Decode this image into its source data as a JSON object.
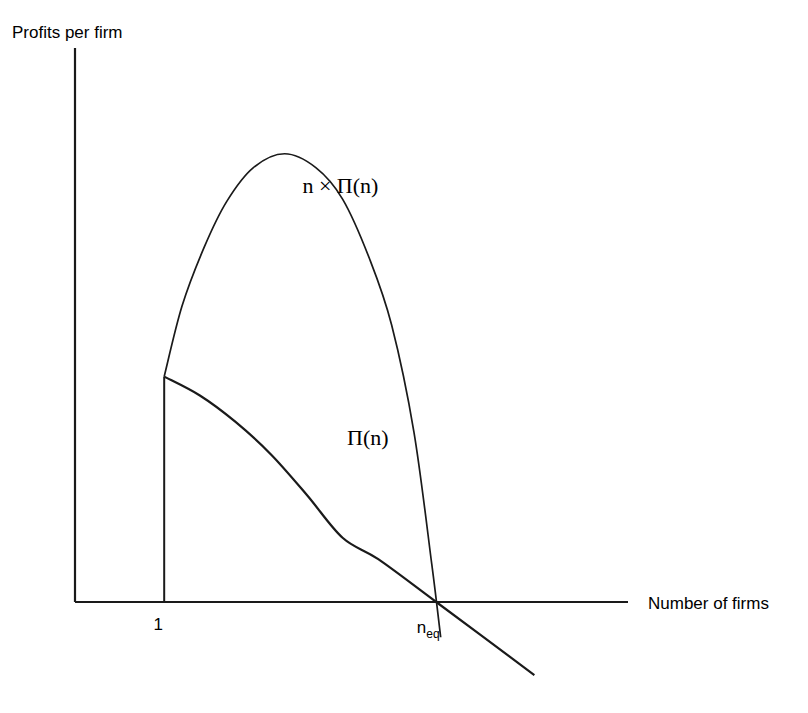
{
  "chart_data": {
    "type": "line",
    "title": "",
    "xlabel": "Number of firms",
    "ylabel": "Profits per firm",
    "grid": false,
    "legend": "inline-annotations",
    "xlim": [
      0,
      6.2
    ],
    "ylim": [
      -1.35,
      4.4
    ],
    "x_ticks": [
      {
        "label": "1",
        "value": 1
      },
      {
        "label": "n",
        "sub": "eq",
        "value": 4.05
      }
    ],
    "annotations": [
      {
        "text": "n × Π(n)",
        "x": 2.55,
        "y": 3.25
      },
      {
        "text": "Π(n)",
        "x": 3.05,
        "y": 1.25
      }
    ],
    "series": [
      {
        "name": "n × Π(n)",
        "label": "n × Π(n)",
        "color": "#1a1a1a",
        "description": "Aggregate industry profit; rises from n=1, peaks near n=2.35, then falls steeply to zero at n_eq",
        "points": [
          [
            1.0,
            1.79
          ],
          [
            1.2,
            2.35
          ],
          [
            1.45,
            2.82
          ],
          [
            1.7,
            3.18
          ],
          [
            2.0,
            3.45
          ],
          [
            2.35,
            3.56
          ],
          [
            2.7,
            3.45
          ],
          [
            3.0,
            3.2
          ],
          [
            3.3,
            2.73
          ],
          [
            3.55,
            2.2
          ],
          [
            3.8,
            1.35
          ],
          [
            4.0,
            0.3
          ],
          [
            4.1,
            -0.28
          ]
        ]
      },
      {
        "name": "Π(n)",
        "label": "Π(n)",
        "color": "#1a1a1a",
        "description": "Per-firm profit; starts at n=1, declines concavely then linearly, crossing zero at n_eq and continuing negative",
        "points": [
          [
            1.0,
            1.79
          ],
          [
            1.4,
            1.64
          ],
          [
            1.8,
            1.43
          ],
          [
            2.2,
            1.17
          ],
          [
            2.6,
            0.85
          ],
          [
            3.0,
            0.51
          ],
          [
            3.4,
            0.34
          ],
          [
            4.05,
            0.0
          ],
          [
            5.15,
            -0.58
          ]
        ]
      }
    ],
    "reference_lines": [
      {
        "name": "n-equals-one-vertical",
        "x": 1,
        "y_from": 0,
        "y_to": 1.79
      }
    ],
    "axis_origin_value": 0
  },
  "colors": {
    "axis": "#1a1a1a",
    "curve": "#1a1a1a",
    "background": "#ffffff",
    "text": "#000000"
  }
}
